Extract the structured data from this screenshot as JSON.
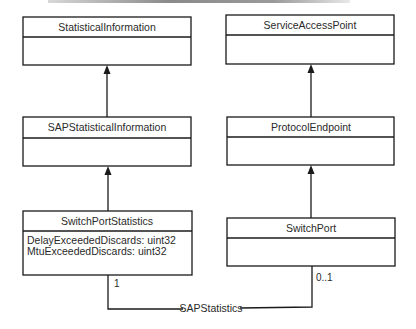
{
  "diagram": {
    "type": "UML class diagram",
    "classes": [
      {
        "id": "statistical-information",
        "name": "StatisticalInformation",
        "attributes": []
      },
      {
        "id": "service-access-point",
        "name": "ServiceAccessPoint",
        "attributes": []
      },
      {
        "id": "sap-statistical-information",
        "name": "SAPStatisticalInformation",
        "attributes": []
      },
      {
        "id": "protocol-endpoint",
        "name": "ProtocolEndpoint",
        "attributes": []
      },
      {
        "id": "switch-port-statistics",
        "name": "SwitchPortStatistics",
        "attributes": [
          "DelayExceededDiscards: uint32",
          "MtuExceededDiscards: uint32"
        ]
      },
      {
        "id": "switch-port",
        "name": "SwitchPort",
        "attributes": []
      }
    ],
    "inheritance": [
      {
        "child": "SAPStatisticalInformation",
        "parent": "StatisticalInformation"
      },
      {
        "child": "SwitchPortStatistics",
        "parent": "SAPStatisticalInformation"
      },
      {
        "child": "ProtocolEndpoint",
        "parent": "ServiceAccessPoint"
      },
      {
        "child": "SwitchPort",
        "parent": "ProtocolEndpoint"
      }
    ],
    "associations": [
      {
        "name": "SAPStatistics",
        "from": "SwitchPortStatistics",
        "from_multiplicity": "1",
        "to": "SwitchPort",
        "to_multiplicity": "0..1"
      }
    ]
  }
}
